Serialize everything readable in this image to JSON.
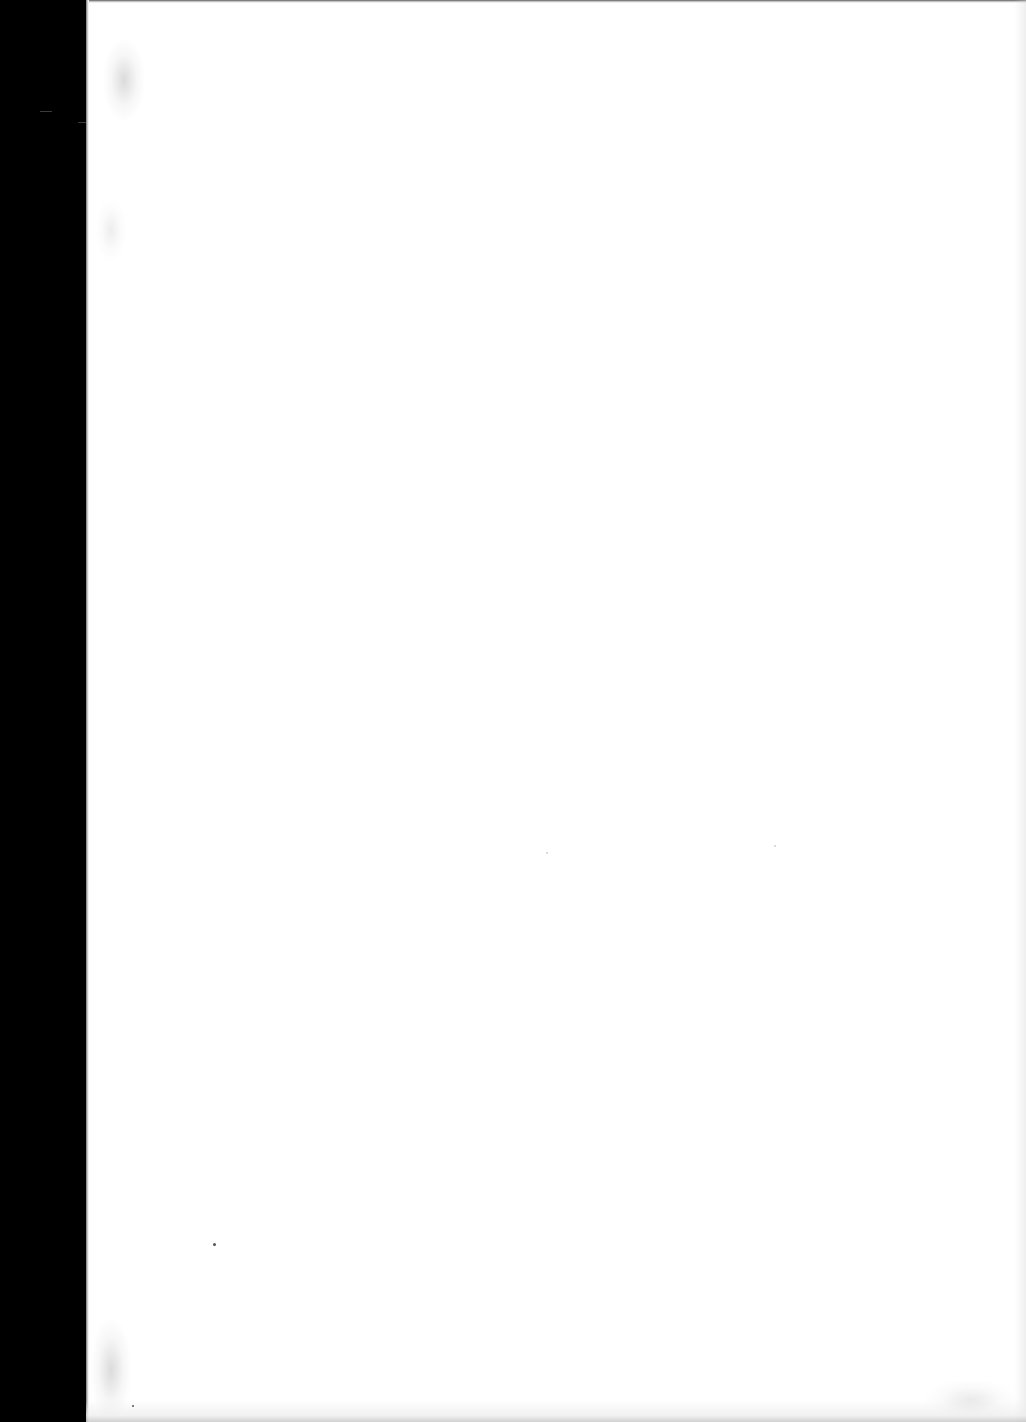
{
  "document": {
    "type": "scanned-page",
    "content": "",
    "is_blank": true
  },
  "colors": {
    "page_background": "#ffffff",
    "scanner_border": "#000000"
  }
}
